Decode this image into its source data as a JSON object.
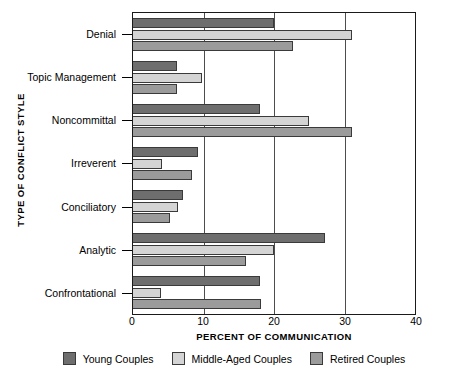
{
  "chart_data": {
    "type": "bar",
    "orientation": "horizontal",
    "title": "",
    "xlabel": "PERCENT OF COMMUNICATION",
    "ylabel": "TYPE OF CONFLICT STYLE",
    "xlim": [
      0,
      40
    ],
    "xticks": [
      0,
      10,
      20,
      30,
      40
    ],
    "xtick_labels": [
      "0",
      "10",
      "20",
      "30",
      "40"
    ],
    "grid": true,
    "legend_position": "bottom",
    "categories": [
      "Denial",
      "Topic Management",
      "Noncommittal",
      "Irreverent",
      "Conciliatory",
      "Analytic",
      "Confrontational"
    ],
    "series": [
      {
        "name": "Young Couples",
        "color": "#6e6e6e",
        "values": [
          20.0,
          6.3,
          18.0,
          9.2,
          7.1,
          27.3,
          18.0
        ]
      },
      {
        "name": "Middle-Aged Couples",
        "color": "#d4d4d4",
        "values": [
          31.0,
          9.8,
          25.0,
          4.1,
          6.4,
          20.0,
          4.0
        ]
      },
      {
        "name": "Retired Couples",
        "color": "#9b9b9b",
        "values": [
          22.7,
          6.3,
          31.0,
          8.4,
          5.3,
          16.0,
          18.1
        ]
      }
    ]
  }
}
